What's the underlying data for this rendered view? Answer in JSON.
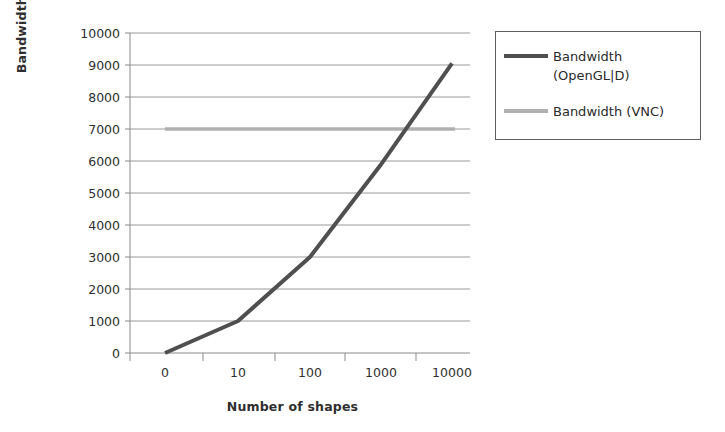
{
  "chart_data": {
    "type": "line",
    "title": "",
    "xlabel": "Number of shapes",
    "ylabel": "Bandwidth (Bytes/s)",
    "x_tick_labels": [
      "0",
      "10",
      "100",
      "1000",
      "10000"
    ],
    "x_categories": [
      0,
      10,
      100,
      1000,
      10000
    ],
    "y_tick_labels": [
      "0",
      "1000",
      "2000",
      "3000",
      "4000",
      "5000",
      "6000",
      "7000",
      "8000",
      "9000",
      "10000"
    ],
    "ylim": [
      0,
      10000
    ],
    "y_step": 1000,
    "grid": "horizontal",
    "legend_position": "right",
    "series": [
      {
        "name": "Bandwidth (OpenGL|D)",
        "label_line1": "Bandwidth",
        "label_line2": "(OpenGL|D)",
        "color": "#4f4f4f",
        "values": [
          0,
          1000,
          3000,
          5850,
          9050
        ]
      },
      {
        "name": "Bandwidth (VNC)",
        "label_line1": "Bandwidth (VNC)",
        "label_line2": "",
        "color": "#b0b0b0",
        "values": [
          7000,
          7000,
          7000,
          7000,
          7000
        ]
      }
    ]
  },
  "axes": {
    "x_title": "Number of shapes",
    "y_title": "Bandwidth (Bytes/s)",
    "y_ticks": [
      "10000",
      "9000",
      "8000",
      "7000",
      "6000",
      "5000",
      "4000",
      "3000",
      "2000",
      "1000",
      "0"
    ],
    "x_ticks": [
      "0",
      "10",
      "100",
      "1000",
      "10000"
    ]
  },
  "legend": {
    "items": [
      {
        "label": "Bandwidth\n(OpenGL|D)",
        "color": "#4f4f4f"
      },
      {
        "label": "Bandwidth (VNC)",
        "color": "#b0b0b0"
      }
    ]
  },
  "colors": {
    "grid": "#9a9a9a",
    "axis": "#8a8a8a",
    "series_opengl": "#4f4f4f",
    "series_vnc": "#b0b0b0",
    "text": "#2f2f2f",
    "background": "#ffffff"
  }
}
